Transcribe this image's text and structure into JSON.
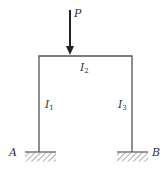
{
  "diagram": {
    "type": "portal-frame",
    "load": {
      "label": "P",
      "direction": "down"
    },
    "members": [
      {
        "name": "left-column",
        "label": "I",
        "subscript": "1"
      },
      {
        "name": "beam",
        "label": "I",
        "subscript": "2"
      },
      {
        "name": "right-column",
        "label": "I",
        "subscript": "3"
      }
    ],
    "supports": [
      {
        "name": "A",
        "label": "A",
        "type": "fixed"
      },
      {
        "name": "B",
        "label": "B",
        "type": "fixed"
      }
    ],
    "colors": {
      "line": "#555555",
      "text": "#333333",
      "arrow": "#222222"
    }
  }
}
